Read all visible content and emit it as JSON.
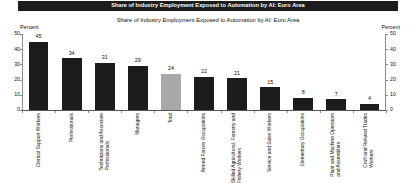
{
  "header": {
    "banner_title": "Share of Industry Employment Exposed to Automation by AI: Euro Area",
    "subtitle": "Share of Industry Employment Exposed to Automation by AI: Euro Area"
  },
  "axes": {
    "left_unit_label": "Percent",
    "right_unit_label": "Percent",
    "ticks": [
      "0",
      "10",
      "20",
      "30",
      "40",
      "50"
    ]
  },
  "chart_data": {
    "type": "bar",
    "title": "Share of Industry Employment Exposed to Automation by AI: Euro Area",
    "xlabel": "",
    "ylabel": "Percent",
    "ylim": [
      0,
      50
    ],
    "yticks": [
      0,
      10,
      20,
      30,
      40,
      50
    ],
    "grid": false,
    "legend": "none",
    "series_name": "Share of industry employment exposed to automation by AI",
    "categories": [
      "Clerical Support Workers",
      "Professionals",
      "Technicians and Associate Professionals",
      "Managers",
      "Total",
      "Armed Forces Occupations",
      "Skilled Agricultural, Forestry and Fishery Workers",
      "Service and Sales Workers",
      "Elementary Occupations",
      "Plant and Machine Operators and Assemblers",
      "Craft and Related Trades Workers"
    ],
    "category_lines": [
      [
        "Clerical Support Workers"
      ],
      [
        "Professionals"
      ],
      [
        "Technicians and Associate",
        "Professionals"
      ],
      [
        "Managers"
      ],
      [
        "Total"
      ],
      [
        "Armed Forces Occupations"
      ],
      [
        "Skilled Agricultural, Forestry and",
        "Fishery Workers"
      ],
      [
        "Service and Sales Workers"
      ],
      [
        "Elementary Occupations"
      ],
      [
        "Plant and Machine Operators",
        "and Assemblers"
      ],
      [
        "Craft and Related Trades",
        "Workers"
      ]
    ],
    "values": [
      45,
      34,
      31,
      29,
      24,
      22,
      21,
      15,
      8,
      7,
      4
    ],
    "value_labels": [
      "45",
      "34",
      "31",
      "29",
      "24",
      "22",
      "21",
      "15",
      "8",
      "7",
      "4"
    ],
    "highlight_index": 4,
    "colors": {
      "bar": "#1c1c1c",
      "highlight_bar": "#a8a8a8",
      "banner_background": "#1c1c1c",
      "banner_text": "#ffffff",
      "axis": "#8d8d8d",
      "text": "#111111"
    }
  }
}
